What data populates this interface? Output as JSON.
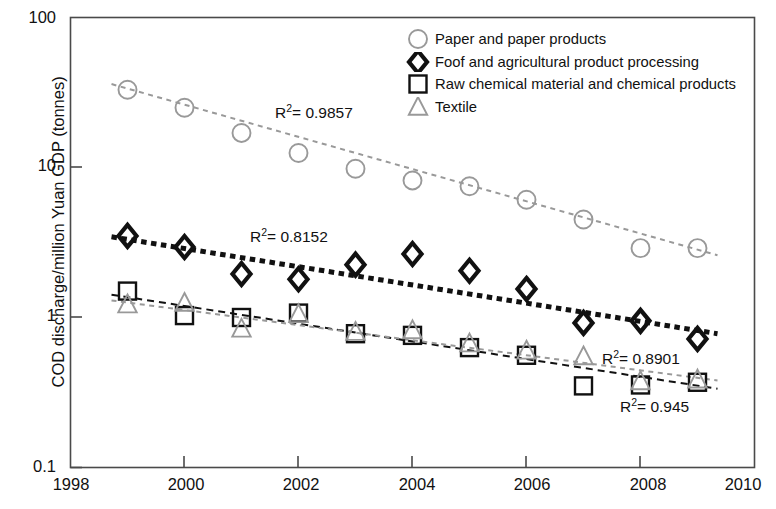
{
  "chart_data": {
    "type": "scatter",
    "title": "",
    "xlabel": "",
    "ylabel": "COD discharge/million Yuan GDP (tonnes)",
    "yscale": "log",
    "ylim": [
      0.1,
      100
    ],
    "xlim": [
      1998,
      2010
    ],
    "grid": false,
    "legend_position": "top-right",
    "y_ticks": [
      "100",
      "10",
      "1",
      "0.1"
    ],
    "y_tick_values": [
      100,
      10,
      1,
      0.1
    ],
    "x_ticks": [
      "1998",
      "2000",
      "2002",
      "2004",
      "2006",
      "2008",
      "2010"
    ],
    "x_tick_values": [
      1998,
      2000,
      2002,
      2004,
      2006,
      2008,
      2010
    ],
    "x": [
      1999,
      2000,
      2001,
      2002,
      2003,
      2004,
      2005,
      2006,
      2007,
      2008,
      2009
    ],
    "series": [
      {
        "name": "Paper and paper products",
        "marker": "circle",
        "color": "#999999",
        "r2": "0.9857",
        "values": [
          33,
          25,
          17,
          12.5,
          9.8,
          8.2,
          7.5,
          6.1,
          4.5,
          2.9,
          2.9
        ],
        "trend_start": 36.0,
        "trend_end": 2.6
      },
      {
        "name": "Foof and agricultural product processing",
        "marker": "diamond",
        "color": "#111111",
        "r2": "0.8152",
        "values": [
          3.5,
          2.95,
          1.95,
          1.8,
          2.25,
          2.65,
          2.05,
          1.55,
          0.92,
          0.95,
          0.72
        ],
        "trend_start": 3.45,
        "trend_end": 0.78
      },
      {
        "name": "Raw chemical material and chemical products",
        "marker": "square",
        "color": "#111111",
        "r2": "0.945",
        "values": [
          1.5,
          1.03,
          1.0,
          1.07,
          0.78,
          0.76,
          0.63,
          0.56,
          0.35,
          0.355,
          0.37
        ],
        "trend_start": 1.42,
        "trend_end": 0.335
      },
      {
        "name": "Textile",
        "marker": "triangle",
        "color": "#999999",
        "r2": "0.8901",
        "values": [
          1.22,
          1.25,
          0.84,
          1.05,
          0.8,
          0.82,
          0.67,
          0.6,
          0.55,
          0.375,
          0.385
        ],
        "trend_start": 1.3,
        "trend_end": 0.38
      }
    ],
    "annotations": [
      {
        "text": "R2 = 0.9857",
        "label": "R",
        "exp": "2",
        "rest": "= 0.9857",
        "x_px": 275,
        "y_px": 102
      },
      {
        "text": "R2 = 0.8152",
        "label": "R",
        "exp": "2",
        "rest": "= 0.8152",
        "x_px": 250,
        "y_px": 226
      },
      {
        "text": "R2 = 0.8901",
        "label": "R",
        "exp": "2",
        "rest": "= 0.8901",
        "x_px": 602,
        "y_px": 348
      },
      {
        "text": "R2 = 0.945",
        "label": "R",
        "exp": "2",
        "rest": "= 0.945",
        "x_px": 620,
        "y_px": 396
      }
    ]
  },
  "axes": {
    "y_label": "COD discharge/million Yuan GDP (tonnes)",
    "y_tick_100": "100",
    "y_tick_10": "10",
    "y_tick_1": "1",
    "y_tick_01": "0.1",
    "x_tick_1998": "1998",
    "x_tick_2000": "2000",
    "x_tick_2002": "2002",
    "x_tick_2004": "2004",
    "x_tick_2006": "2006",
    "x_tick_2008": "2008",
    "x_tick_2010": "2010"
  },
  "legend": {
    "items": [
      {
        "label": "Paper and paper products",
        "marker": "circle-marker-icon"
      },
      {
        "label": "Foof and agricultural product processing",
        "marker": "diamond-marker-icon"
      },
      {
        "label": "Raw chemical material and chemical products",
        "marker": "square-marker-icon"
      },
      {
        "label": "Textile",
        "marker": "triangle-marker-icon"
      }
    ]
  },
  "r2_labels": {
    "paper": "= 0.9857",
    "food": "= 0.8152",
    "textile": "= 0.8901",
    "chemical": "= 0.945",
    "r_char": "R",
    "exp": "2"
  }
}
